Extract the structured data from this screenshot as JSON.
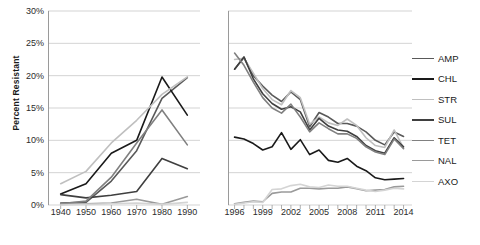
{
  "chart_data": {
    "type": "line",
    "title": "",
    "xlabel": "",
    "ylabel": "Percent Resistant",
    "ylim": [
      0,
      30
    ],
    "yticks": [
      "0%",
      "5%",
      "10%",
      "15%",
      "20%",
      "25%",
      "30%"
    ],
    "ytick_values": [
      0,
      5,
      10,
      15,
      20,
      25,
      30
    ],
    "grid": true,
    "legend_position": "right",
    "legend": [
      "AMP",
      "CHL",
      "STR",
      "SUL",
      "TET",
      "NAL",
      "AXO"
    ],
    "series_colors": {
      "AMP": "#595959",
      "CHL": "#1a1a1a",
      "STR": "#bfbfbf",
      "SUL": "#3f3f3f",
      "TET": "#808080",
      "NAL": "#9a9a9a",
      "AXO": "#d4d4d4"
    },
    "panels": [
      {
        "name": "historical",
        "xlabel": "",
        "xticks": [
          "1940",
          "1950",
          "1960",
          "1970",
          "1980",
          "1990"
        ],
        "x": [
          1940,
          1950,
          1960,
          1970,
          1980,
          1990
        ],
        "xlim": [
          1935,
          1995
        ],
        "series": [
          {
            "name": "AMP",
            "values": [
              0.3,
              0.4,
              3.7,
              8.4,
              16.5,
              19.7
            ]
          },
          {
            "name": "CHL",
            "values": [
              1.7,
              3.3,
              8.0,
              10.0,
              19.8,
              13.9
            ]
          },
          {
            "name": "STR",
            "values": [
              3.3,
              5.2,
              9.6,
              13.1,
              17.1,
              19.8
            ]
          },
          {
            "name": "SUL",
            "values": [
              1.6,
              1.1,
              1.5,
              2.1,
              7.2,
              5.6
            ]
          },
          {
            "name": "TET",
            "values": [
              0.2,
              0.6,
              4.3,
              9.6,
              14.7,
              9.3
            ]
          },
          {
            "name": "NAL",
            "values": [
              0.1,
              0.2,
              0.3,
              0.9,
              0.1,
              1.3
            ]
          },
          {
            "name": "AXO",
            "values": [
              0.0,
              0.1,
              0.2,
              0.3,
              0.1,
              0.4
            ]
          }
        ]
      },
      {
        "name": "recent",
        "xlabel": "",
        "xticks": [
          "1996",
          "1999",
          "2002",
          "2005",
          "2008",
          "2011",
          "2014"
        ],
        "x": [
          1996,
          1997,
          1998,
          1999,
          2000,
          2001,
          2002,
          2003,
          2004,
          2005,
          2006,
          2007,
          2008,
          2009,
          2010,
          2011,
          2012,
          2013,
          2014
        ],
        "xlim": [
          1995.3,
          2014.9
        ],
        "series": [
          {
            "name": "AMP",
            "values": [
              21.0,
              22.8,
              20.0,
              18.4,
              17.0,
              16.0,
              17.5,
              16.3,
              12.1,
              14.3,
              13.6,
              12.6,
              12.6,
              12.2,
              11.3,
              10.0,
              9.3,
              11.3,
              10.6
            ]
          },
          {
            "name": "CHL",
            "values": [
              10.5,
              10.2,
              9.5,
              8.5,
              9.0,
              11.2,
              8.6,
              10.1,
              7.8,
              8.5,
              6.9,
              6.6,
              7.2,
              6.0,
              5.3,
              4.2,
              3.9,
              4.0,
              4.1
            ]
          },
          {
            "name": "STR",
            "values": [
              22.5,
              22.7,
              20.4,
              18.0,
              16.3,
              15.5,
              17.7,
              16.6,
              12.5,
              13.6,
              12.7,
              12.3,
              13.3,
              12.3,
              10.4,
              9.2,
              8.9,
              11.6,
              8.8
            ]
          },
          {
            "name": "SUL",
            "values": [
              21.0,
              22.9,
              19.5,
              17.2,
              15.7,
              14.8,
              15.2,
              14.4,
              11.6,
              13.4,
              12.2,
              11.6,
              11.4,
              10.6,
              9.2,
              8.4,
              8.0,
              10.4,
              9.0
            ]
          },
          {
            "name": "TET",
            "values": [
              23.5,
              21.6,
              19.0,
              16.6,
              15.0,
              14.2,
              15.6,
              13.6,
              11.3,
              12.7,
              11.8,
              11.0,
              11.0,
              10.3,
              9.0,
              8.2,
              7.8,
              10.2,
              8.7
            ]
          },
          {
            "name": "NAL",
            "values": [
              0.2,
              0.4,
              0.6,
              0.5,
              1.8,
              2.0,
              2.0,
              2.6,
              2.6,
              2.5,
              2.6,
              2.6,
              2.8,
              2.5,
              2.2,
              2.3,
              2.4,
              2.8,
              2.9
            ]
          },
          {
            "name": "AXO",
            "values": [
              0.1,
              0.3,
              0.5,
              0.4,
              2.4,
              2.5,
              3.0,
              3.2,
              2.8,
              2.7,
              3.1,
              2.9,
              2.9,
              2.6,
              2.3,
              2.1,
              2.3,
              2.6,
              2.5
            ]
          }
        ]
      }
    ]
  }
}
